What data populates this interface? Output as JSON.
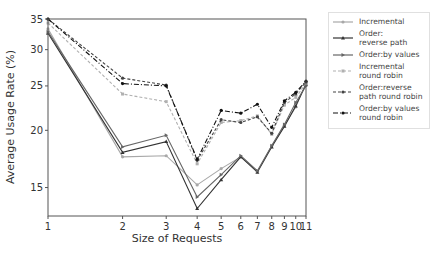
{
  "chart_data": {
    "type": "line",
    "title": "",
    "xlabel": "Size of Requests",
    "ylabel": "Average Usage Rate (%)",
    "xscale": "log",
    "yscale": "log",
    "xlim": [
      1,
      11
    ],
    "ylim": [
      13,
      35
    ],
    "x": [
      1,
      2,
      3,
      4,
      5,
      6,
      7,
      8,
      9,
      10,
      11
    ],
    "x_tick_labels": [
      "1",
      "2",
      "3",
      "4",
      "5",
      "6",
      "7",
      "8",
      "9",
      "10",
      "11"
    ],
    "y_ticks": [
      15,
      20,
      25,
      30,
      35
    ],
    "y_tick_labels": [
      "15",
      "20",
      "25",
      "30",
      "35"
    ],
    "grid": false,
    "legend_position": "outside right",
    "series": [
      {
        "name": "Incremental",
        "color": "#a8a8a8",
        "dash": "",
        "marker": "circle",
        "values": [
          33.3,
          17.5,
          17.6,
          15.2,
          16.5,
          17.5,
          16.3,
          18.5,
          20.5,
          22.5,
          25.3
        ]
      },
      {
        "name": "Order:\nreverse path",
        "color": "#333333",
        "dash": "",
        "marker": "triangle",
        "values": [
          32.6,
          17.9,
          18.9,
          13.5,
          15.6,
          17.5,
          16.2,
          18.4,
          20.4,
          22.6,
          25.2
        ]
      },
      {
        "name": "Order:by values",
        "color": "#666666",
        "dash": "",
        "marker": "triangle-right",
        "values": [
          32.8,
          18.4,
          19.5,
          14.3,
          16.0,
          17.6,
          16.3,
          18.5,
          20.6,
          23.0,
          25.0
        ]
      },
      {
        "name": "Incremental\nround robin",
        "color": "#b0b0b0",
        "dash": "3,2",
        "marker": "square",
        "values": [
          34.3,
          24.0,
          23.1,
          16.9,
          20.8,
          21.0,
          21.5,
          19.6,
          22.7,
          23.6,
          25.3
        ]
      },
      {
        "name": "Order:reverse\npath round robin",
        "color": "#444444",
        "dash": "3,2",
        "marker": "circle",
        "values": [
          35.0,
          26.0,
          25.1,
          17.2,
          21.1,
          20.8,
          21.4,
          19.7,
          23.0,
          24.0,
          25.5
        ]
      },
      {
        "name": "Order:by values\nround robin",
        "color": "#111111",
        "dash": "5,2,1,2",
        "marker": "circle",
        "values": [
          35.0,
          25.3,
          25.0,
          17.3,
          22.1,
          21.8,
          22.8,
          20.3,
          23.2,
          24.2,
          25.6
        ]
      }
    ]
  }
}
